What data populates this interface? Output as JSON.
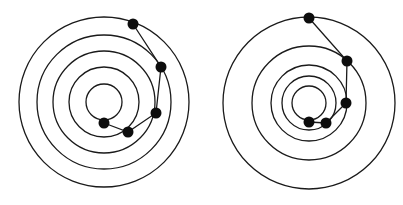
{
  "colors": {
    "stroke": "#1a1a1a",
    "dot": "#0d0d0d",
    "background": "#ffffff"
  },
  "diagrams": [
    {
      "name": "left-target",
      "center": [
        104,
        102
      ],
      "radii": [
        85,
        67,
        51,
        35,
        18
      ],
      "points": [
        [
          133,
          24
        ],
        [
          161,
          67
        ],
        [
          156,
          113
        ],
        [
          128,
          132
        ],
        [
          104,
          123
        ]
      ]
    },
    {
      "name": "right-target",
      "center": [
        309,
        103
      ],
      "radii": [
        86,
        57,
        38,
        27,
        17
      ],
      "points": [
        [
          309,
          18
        ],
        [
          347,
          61
        ],
        [
          346,
          103
        ],
        [
          326,
          123
        ],
        [
          309,
          122
        ]
      ]
    }
  ]
}
